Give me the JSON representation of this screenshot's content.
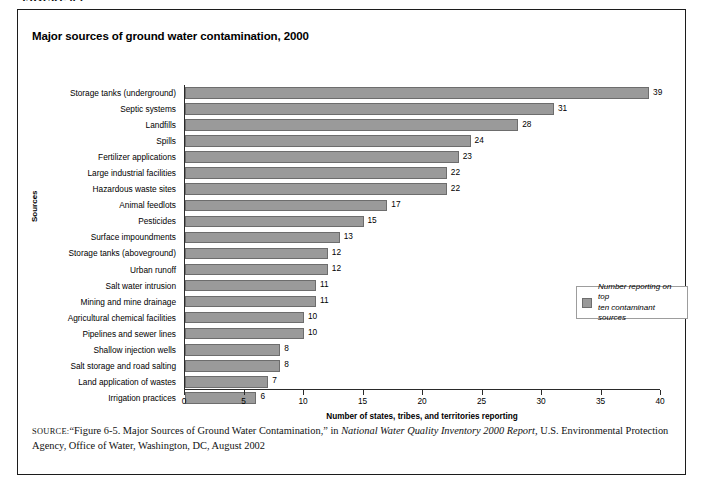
{
  "figure_caption": "FIGURE 6.1",
  "chart_title": "Major sources of ground water contamination, 2000",
  "legend": {
    "swatch_color": "#9a9a9a",
    "label_line1": "Number reporting on top",
    "label_line2": "ten contaminant sources"
  },
  "source_note": {
    "label": "SOURCE:",
    "part1": "“Figure 6-5. Major Sources of Ground Water Contamination,” in ",
    "italic": "National Water Quality Inventory 2000 Report,",
    "part2": " U.S. Environmental Protection Agency, Office of Water, Washington, DC, August 2002"
  },
  "chart_data": {
    "type": "bar",
    "orientation": "horizontal",
    "title": "Major sources of ground water contamination, 2000",
    "xlabel": "Number of states, tribes, and territories reporting",
    "ylabel": "Sources",
    "xlim": [
      0,
      40
    ],
    "xticks": [
      0,
      5,
      10,
      15,
      20,
      25,
      30,
      35,
      40
    ],
    "grid": false,
    "legend_position": "right-middle",
    "bar_color": "#9a9a9a",
    "bar_border_color": "#6d6d6d",
    "series": [
      {
        "name": "Number reporting on top ten contaminant sources",
        "values": [
          39,
          31,
          28,
          24,
          23,
          22,
          22,
          17,
          15,
          13,
          12,
          12,
          11,
          11,
          10,
          10,
          8,
          8,
          7,
          6
        ]
      }
    ],
    "categories": [
      "Storage tanks (underground)",
      "Septic systems",
      "Landfills",
      "Spills",
      "Fertilizer applications",
      "Large industrial facilities",
      "Hazardous waste sites",
      "Animal feedlots",
      "Pesticides",
      "Surface impoundments",
      "Storage tanks (aboveground)",
      "Urban runoff",
      "Salt water intrusion",
      "Mining and mine drainage",
      "Agricultural chemical facilities",
      "Pipelines and sewer lines",
      "Shallow injection wells",
      "Salt storage and road salting",
      "Land application of wastes",
      "Irrigation practices"
    ]
  }
}
